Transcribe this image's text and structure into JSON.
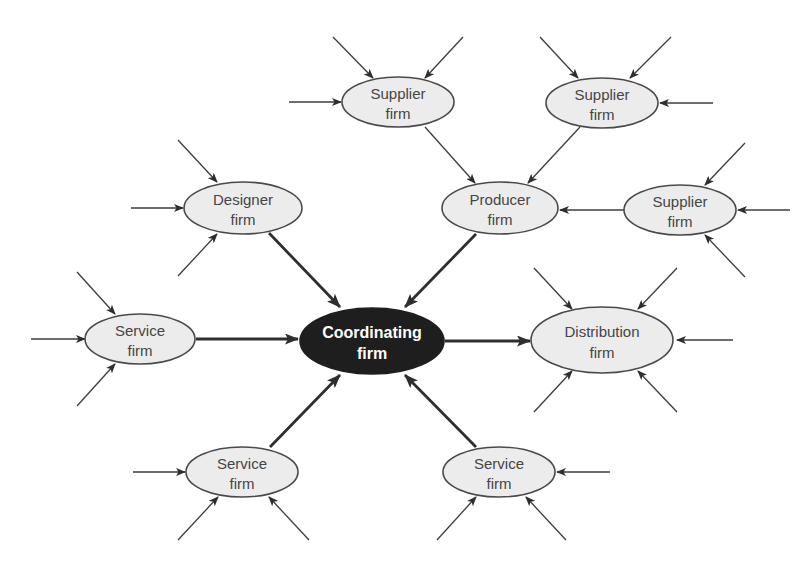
{
  "diagram": {
    "type": "network-organization",
    "nodes": {
      "coordinating": {
        "line1": "Coordinating",
        "line2": "firm"
      },
      "supplier_top_left": {
        "line1": "Supplier",
        "line2": "firm"
      },
      "supplier_top_right": {
        "line1": "Supplier",
        "line2": "firm"
      },
      "supplier_right": {
        "line1": "Supplier",
        "line2": "firm"
      },
      "producer": {
        "line1": "Producer",
        "line2": "firm"
      },
      "designer": {
        "line1": "Designer",
        "line2": "firm"
      },
      "service_left": {
        "line1": "Service",
        "line2": "firm"
      },
      "distribution": {
        "line1": "Distribution",
        "line2": "firm"
      },
      "service_bottom_left": {
        "line1": "Service",
        "line2": "firm"
      },
      "service_bottom_right": {
        "line1": "Service",
        "line2": "firm"
      }
    },
    "edges": [
      {
        "from": "supplier_top_left",
        "to": "producer"
      },
      {
        "from": "supplier_top_right",
        "to": "producer"
      },
      {
        "from": "supplier_right",
        "to": "producer"
      },
      {
        "from": "designer",
        "to": "coordinating"
      },
      {
        "from": "producer",
        "to": "coordinating"
      },
      {
        "from": "service_left",
        "to": "coordinating"
      },
      {
        "from": "coordinating",
        "to": "distribution"
      },
      {
        "from": "service_bottom_left",
        "to": "coordinating"
      },
      {
        "from": "service_bottom_right",
        "to": "coordinating"
      }
    ],
    "colors": {
      "node_fill": "#ececec",
      "center_fill": "#1e1e1e",
      "stroke": "#4a4a4a",
      "text": "#454545"
    }
  }
}
